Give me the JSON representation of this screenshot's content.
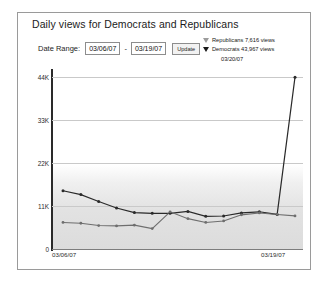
{
  "chart_title": "Daily views for Democrats and Republicans",
  "controls": {
    "range_label": "Date Range:",
    "start_date": "03/06/07",
    "separator": "-",
    "end_date": "03/19/07",
    "update_label": "Update"
  },
  "legend": {
    "republicans": "Republicans 7,616 views",
    "democrats": "Democrats 43,967 views",
    "date": "03/20/07"
  },
  "axis": {
    "y_ticks": [
      "44K",
      "33K",
      "22K",
      "11K",
      "0"
    ],
    "x_start": "03/06/07",
    "x_end": "03/19/07"
  },
  "colors": {
    "democrats": "#2a2a2a",
    "republicans": "#6e6e6e",
    "grid": "#c9c9c9",
    "frame": "#9a9a9a"
  },
  "chart_data": {
    "type": "line",
    "title": "Daily views for Democrats and Republicans",
    "xlabel": "",
    "ylabel": "",
    "ylim": [
      0,
      44000
    ],
    "yticks": [
      0,
      11000,
      22000,
      33000,
      44000
    ],
    "grid": true,
    "legend_position": "top-right",
    "x": [
      "03/06/07",
      "03/07/07",
      "03/08/07",
      "03/09/07",
      "03/10/07",
      "03/11/07",
      "03/12/07",
      "03/13/07",
      "03/14/07",
      "03/15/07",
      "03/16/07",
      "03/17/07",
      "03/18/07",
      "03/19/07"
    ],
    "series": [
      {
        "name": "Democrats",
        "marker": "dot",
        "values": [
          14200,
          13200,
          11400,
          9700,
          8500,
          8300,
          8300,
          8800,
          7500,
          7600,
          8400,
          8700,
          8000,
          43967
        ]
      },
      {
        "name": "Republicans",
        "marker": "dot",
        "values": [
          5900,
          5700,
          5100,
          5000,
          5200,
          4300,
          8700,
          6900,
          5900,
          6300,
          7900,
          8400,
          8000,
          7616
        ]
      }
    ],
    "annotations": [
      "Republicans 7,616 views",
      "Democrats 43,967 views",
      "03/20/07"
    ]
  }
}
